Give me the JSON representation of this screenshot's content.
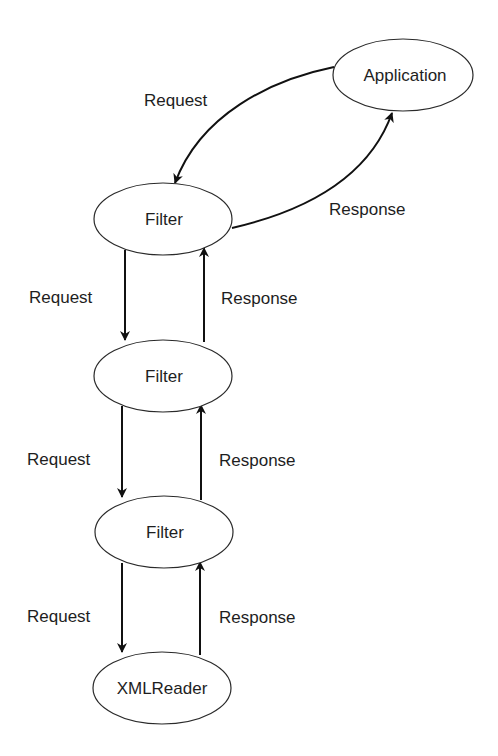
{
  "diagram": {
    "type": "flow",
    "nodes": [
      {
        "id": "application",
        "label": "Application"
      },
      {
        "id": "filter1",
        "label": "Filter"
      },
      {
        "id": "filter2",
        "label": "Filter"
      },
      {
        "id": "filter3",
        "label": "Filter"
      },
      {
        "id": "xmlreader",
        "label": "XMLReader"
      }
    ],
    "edges": [
      {
        "from": "application",
        "to": "filter1",
        "label": "Request"
      },
      {
        "from": "filter1",
        "to": "application",
        "label": "Response"
      },
      {
        "from": "filter1",
        "to": "filter2",
        "label": "Request"
      },
      {
        "from": "filter2",
        "to": "filter1",
        "label": "Response"
      },
      {
        "from": "filter2",
        "to": "filter3",
        "label": "Request"
      },
      {
        "from": "filter3",
        "to": "filter2",
        "label": "Response"
      },
      {
        "from": "filter3",
        "to": "xmlreader",
        "label": "Request"
      },
      {
        "from": "xmlreader",
        "to": "filter3",
        "label": "Response"
      }
    ],
    "colors": {
      "background": "#ffffff",
      "line": "#111111",
      "text": "#1e1e1e"
    }
  }
}
